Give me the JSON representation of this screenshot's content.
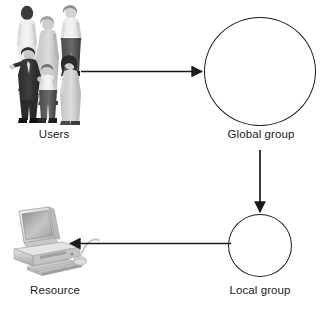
{
  "diagram": {
    "background_color": "#ffffff",
    "line_color": "#1b1b1b",
    "nodes": [
      {
        "id": "users",
        "label": "Users",
        "shape": "people-illustration",
        "icon": "group-of-people-icon"
      },
      {
        "id": "global_group",
        "label": "Global group",
        "shape": "circle",
        "diameter_px": 109
      },
      {
        "id": "local_group",
        "label": "Local group",
        "shape": "circle",
        "diameter_px": 63
      },
      {
        "id": "resource",
        "label": "Resource",
        "shape": "computer-illustration",
        "icon": "desktop-computer-icon"
      }
    ],
    "edges": [
      {
        "id": "users-to-global",
        "from": "users",
        "to": "global_group",
        "direction": "right",
        "label": ""
      },
      {
        "id": "global-to-local",
        "from": "global_group",
        "to": "local_group",
        "direction": "down",
        "label": ""
      },
      {
        "id": "local-to-resource",
        "from": "local_group",
        "to": "resource",
        "direction": "left",
        "label": ""
      }
    ]
  }
}
